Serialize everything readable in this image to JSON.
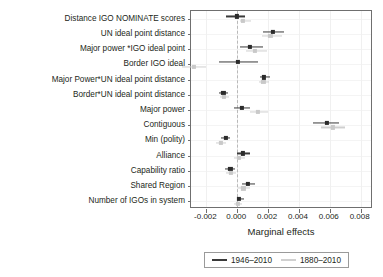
{
  "chart_data": {
    "type": "scatter",
    "title": "",
    "xlabel": "Marginal effects",
    "ylabel": "",
    "xlim": [
      -0.003,
      0.0088
    ],
    "xticks": [
      -0.002,
      0.0,
      0.002,
      0.004,
      0.006,
      0.008
    ],
    "xticklabels": [
      "-0.002",
      "0.000",
      "0.002",
      "0.004",
      "0.006",
      "0.008"
    ],
    "grid": true,
    "zero_reference_line": 0.0,
    "legend_position": "bottom",
    "categories": [
      "Distance IGO NOMINATE scores",
      "UN ideal point distance",
      "Major power *IGO ideal point",
      "Border IGO ideal",
      "Major Power*UN ideal point distance",
      "Border*UN ideal point distance",
      "Major power",
      "Contiguous",
      "Min (polity)",
      "Alliance",
      "Capability ratio",
      "Shared Region",
      "Number of IGOs in system"
    ],
    "series": [
      {
        "name": "1946-2010",
        "color": "#2b2b2b",
        "estimates": [
          0.0,
          0.0023,
          0.0008,
          5e-05,
          0.00175,
          -0.0009,
          0.0003,
          0.0058,
          -0.00075,
          0.00035,
          -0.00045,
          0.0007,
          0.00012
        ],
        "ci_low": [
          -0.00075,
          0.0017,
          0.00015,
          -0.0012,
          0.00145,
          -0.00118,
          -0.0002,
          0.0049,
          -0.00105,
          0.0,
          -0.0008,
          0.0003,
          -5e-05
        ],
        "ci_high": [
          0.00048,
          0.003,
          0.00165,
          0.00135,
          0.0021,
          -0.0006,
          0.00085,
          0.0066,
          -0.00048,
          0.0008,
          -0.00012,
          0.00118,
          0.00042
        ]
      },
      {
        "name": "1880-2010",
        "color": "#c9c9c9",
        "estimates": [
          0.00038,
          0.00215,
          0.00115,
          -0.0028,
          0.0017,
          -0.00085,
          0.00135,
          0.0062,
          -0.00105,
          0.0001,
          -0.0004,
          0.0004,
          3e-05
        ],
        "ci_low": [
          0.00018,
          0.0016,
          0.00058,
          -0.0036,
          0.0014,
          -0.0011,
          0.00082,
          0.0054,
          -0.0014,
          -0.0002,
          -0.00075,
          5e-05,
          -0.00018
        ],
        "ci_high": [
          0.00092,
          0.00288,
          0.00192,
          -0.002,
          0.00205,
          -0.00055,
          0.002,
          0.007,
          -0.00072,
          0.00048,
          -5e-05,
          0.00082,
          0.00028
        ]
      }
    ]
  },
  "legend": {
    "items": [
      {
        "label": "1946–2010",
        "style": "dark"
      },
      {
        "label": "1880–2010",
        "style": "light"
      }
    ]
  }
}
